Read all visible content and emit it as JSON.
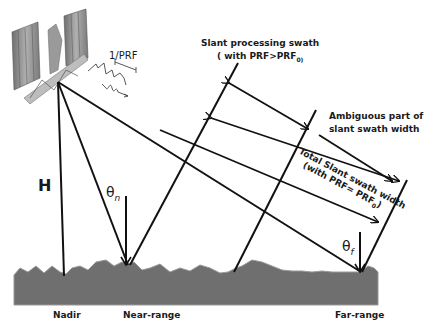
{
  "diagram": {
    "labels": {
      "prf_period": "1/PRF",
      "slant_processing_swath": "Slant processing swath",
      "slant_processing_condition": "( with PRF>PRF",
      "slant_processing_sub": "0)",
      "ambiguous_line1": "Ambiguous part of",
      "ambiguous_line2": "slant swath width",
      "total_line1": "Total Slant swath width",
      "total_line2": "(with PRF= PRF",
      "total_sub": "0",
      "total_close": ")",
      "height": "H",
      "theta": "θ",
      "theta_n_sub": "n",
      "theta_f_sub": "f",
      "nadir": "Nadir",
      "near_range": "Near-range",
      "far_range": "Far-range"
    },
    "colors": {
      "line": "#111111",
      "ground": "#6f6f6f",
      "ground_top": "#8a8a8a",
      "satellite_panel": "#8c8c8c"
    }
  }
}
